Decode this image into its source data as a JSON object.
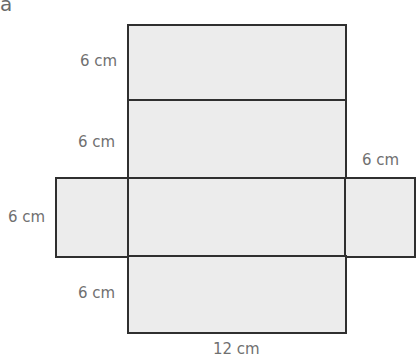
{
  "part_label": "a",
  "net": {
    "description": "Net of a cuboid (12 cm x 6 cm x 6 cm)",
    "fill_color": "#ececec",
    "line_color": "#2f2f2f",
    "faces": [
      {
        "id": "top-face",
        "width_cm": 12,
        "height_cm": 6
      },
      {
        "id": "upper-middle-face",
        "width_cm": 12,
        "height_cm": 6
      },
      {
        "id": "left-face",
        "width_cm": 6,
        "height_cm": 6
      },
      {
        "id": "center-face",
        "width_cm": 12,
        "height_cm": 6
      },
      {
        "id": "right-face",
        "width_cm": 6,
        "height_cm": 6
      },
      {
        "id": "bottom-face",
        "width_cm": 12,
        "height_cm": 6
      }
    ]
  },
  "labels": {
    "top_height": "6 cm",
    "upper_middle_height": "6 cm",
    "left_height": "6 cm",
    "right_width": "6 cm",
    "bottom_height": "6 cm",
    "bottom_width": "12 cm"
  }
}
